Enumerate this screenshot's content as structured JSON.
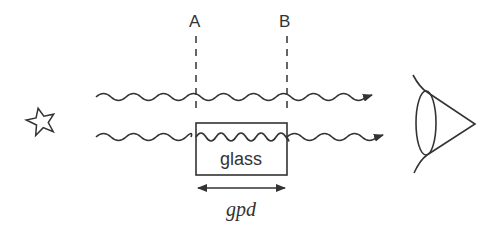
{
  "diagram": {
    "labels": {
      "line_a": "A",
      "line_b": "B",
      "medium": "glass",
      "distance": "gpd"
    },
    "nodes": [
      {
        "id": "source",
        "shape": "star-icon",
        "description": "light source (star)"
      },
      {
        "id": "glass",
        "shape": "rectangle",
        "label": "glass"
      },
      {
        "id": "observer",
        "shape": "eye-icon",
        "description": "eye"
      }
    ],
    "edges": [
      {
        "from": "source",
        "to": "observer",
        "label": "wave through air",
        "style": "wavy-arrow"
      },
      {
        "from": "source",
        "to": "observer",
        "via": "glass",
        "label": "wave through glass (shorter wavelength inside glass)",
        "style": "wavy-arrow"
      }
    ],
    "reference_lines": [
      "A",
      "B"
    ],
    "colors": {
      "stroke": "#333333",
      "background": "#ffffff"
    }
  }
}
